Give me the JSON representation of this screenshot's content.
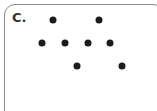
{
  "panel": {
    "label": "C.",
    "border_color": "#8a8a8a",
    "dot_color": "#1c1c1c"
  },
  "dots": [
    {
      "row": 1,
      "x": 53,
      "y": 20
    },
    {
      "row": 1,
      "x": 99,
      "y": 20
    },
    {
      "row": 2,
      "x": 42,
      "y": 43
    },
    {
      "row": 2,
      "x": 65,
      "y": 43
    },
    {
      "row": 2,
      "x": 88,
      "y": 43
    },
    {
      "row": 2,
      "x": 110,
      "y": 43
    },
    {
      "row": 3,
      "x": 77,
      "y": 66
    },
    {
      "row": 3,
      "x": 122,
      "y": 66
    }
  ]
}
